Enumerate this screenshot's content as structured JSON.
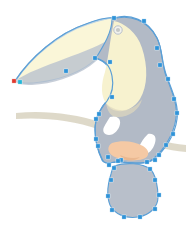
{
  "canvas": {
    "width": 186,
    "height": 233,
    "background": "#ffffff",
    "title": "Toucan vector illustration — path selected"
  },
  "palette": {
    "background": "#ffffff",
    "body_gray": "#b2bac6",
    "body_gray_light": "#c3cad4",
    "breast_cream": "#f7f2cf",
    "beak_cream": "#faf6d8",
    "beak_shadow": "#c9d1da",
    "branch_tan": "#d8d2bf",
    "branch_tan_light": "#e3ddcb",
    "foot_orange": "#f5c9a4",
    "wing_white": "#ffffff",
    "path_stroke": "#5b9fd6",
    "anchor_fill": "#2f93d8",
    "anchor_selected_fill": "#e03a2f",
    "anchor_cyan_fill": "#22b6d8",
    "eye_ring": "#b8c0cb",
    "eye_fill": "#e9eaea"
  },
  "artwork": {
    "name": "toucan",
    "shapes": [
      {
        "id": "branch",
        "label": "perch-branch",
        "fill": "#d8d2bf"
      },
      {
        "id": "beak",
        "label": "beak",
        "fill": "#faf6d8"
      },
      {
        "id": "beak-shade",
        "label": "beak-underside-shadow",
        "fill": "#c3cad4"
      },
      {
        "id": "body",
        "label": "body-and-head",
        "fill": "#b2bac6"
      },
      {
        "id": "breast",
        "label": "breast-patch",
        "fill": "#f7f2cf"
      },
      {
        "id": "wing-mark-1",
        "label": "wing-feather-mark-upper",
        "fill": "#ffffff"
      },
      {
        "id": "wing-mark-2",
        "label": "wing-feather-mark-lower",
        "fill": "#ffffff"
      },
      {
        "id": "foot",
        "label": "foot",
        "fill": "#f5c9a4"
      },
      {
        "id": "tail",
        "label": "tail",
        "fill": "#b2bac6"
      },
      {
        "id": "eye",
        "label": "eye",
        "fill": "#e9eaea"
      }
    ]
  },
  "selection": {
    "path_label": "toucan-outline-path",
    "stroke_color": "#5b9fd6",
    "anchor_count": 34,
    "selected_anchor_index": 0,
    "anchors": [
      {
        "x": 14,
        "y": 81,
        "state": "selected"
      },
      {
        "x": 20,
        "y": 82,
        "state": "cyan"
      },
      {
        "x": 66,
        "y": 71,
        "state": "normal"
      },
      {
        "x": 95,
        "y": 58,
        "state": "normal"
      },
      {
        "x": 110,
        "y": 62,
        "state": "normal"
      },
      {
        "x": 114,
        "y": 18,
        "state": "normal"
      },
      {
        "x": 144,
        "y": 21,
        "state": "normal"
      },
      {
        "x": 157,
        "y": 48,
        "state": "normal"
      },
      {
        "x": 160,
        "y": 65,
        "state": "normal"
      },
      {
        "x": 168,
        "y": 79,
        "state": "normal"
      },
      {
        "x": 174,
        "y": 99,
        "state": "normal"
      },
      {
        "x": 177,
        "y": 113,
        "state": "normal"
      },
      {
        "x": 173,
        "y": 134,
        "state": "normal"
      },
      {
        "x": 166,
        "y": 145,
        "state": "normal"
      },
      {
        "x": 159,
        "y": 155,
        "state": "normal"
      },
      {
        "x": 155,
        "y": 160,
        "state": "normal"
      },
      {
        "x": 147,
        "y": 162,
        "state": "normal"
      },
      {
        "x": 121,
        "y": 160,
        "state": "normal"
      },
      {
        "x": 118,
        "y": 161,
        "state": "normal"
      },
      {
        "x": 109,
        "y": 165,
        "state": "normal"
      },
      {
        "x": 108,
        "y": 157,
        "state": "normal"
      },
      {
        "x": 98,
        "y": 146,
        "state": "normal"
      },
      {
        "x": 96,
        "y": 139,
        "state": "normal"
      },
      {
        "x": 96,
        "y": 119,
        "state": "normal"
      },
      {
        "x": 99,
        "y": 114,
        "state": "normal"
      },
      {
        "x": 112,
        "y": 97,
        "state": "normal"
      },
      {
        "x": 114,
        "y": 168,
        "state": "normal"
      },
      {
        "x": 150,
        "y": 169,
        "state": "normal"
      },
      {
        "x": 155,
        "y": 180,
        "state": "normal"
      },
      {
        "x": 159,
        "y": 195,
        "state": "normal"
      },
      {
        "x": 155,
        "y": 209,
        "state": "normal"
      },
      {
        "x": 140,
        "y": 217,
        "state": "normal"
      },
      {
        "x": 124,
        "y": 217,
        "state": "normal"
      },
      {
        "x": 112,
        "y": 210,
        "state": "normal"
      },
      {
        "x": 108,
        "y": 196,
        "state": "normal"
      },
      {
        "x": 111,
        "y": 180,
        "state": "normal"
      }
    ]
  }
}
